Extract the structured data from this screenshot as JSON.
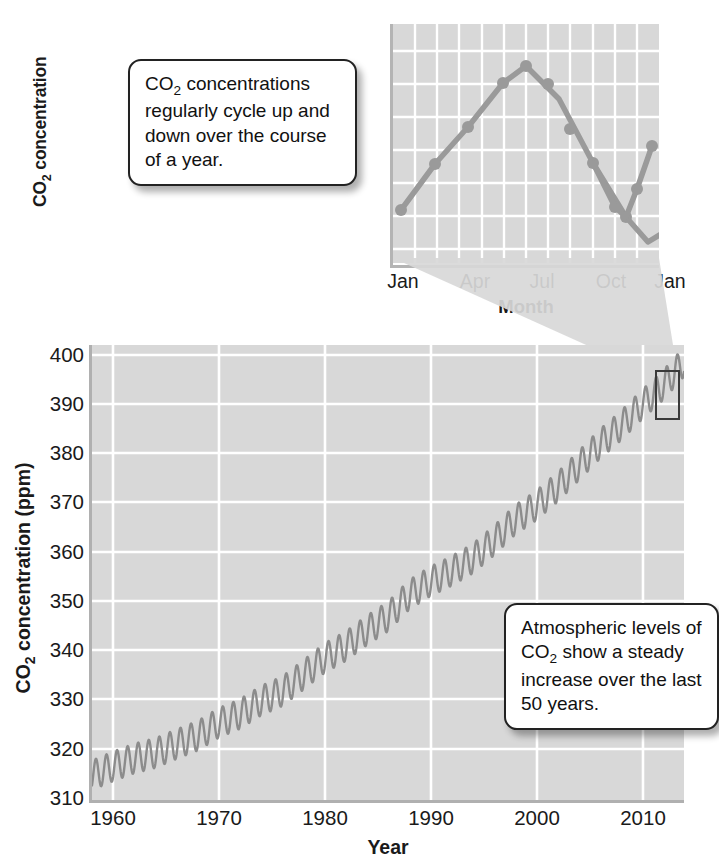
{
  "callouts": {
    "seasonal": "CO2 concentrations regularly cycle up and down over the course of a year.",
    "trend": "Atmospheric levels of CO2 show a steady increase over the last 50 years."
  },
  "colors": {
    "plot_background": "#d8d8d8",
    "gridline": "#ffffff",
    "data_line": "#8c8c8c",
    "axis": "#b0b0b0",
    "highlight_box": "#3a3a3a",
    "text": "#111111"
  },
  "chart_data": [
    {
      "id": "main",
      "type": "line",
      "title": "",
      "xlabel": "Year",
      "ylabel": "CO2 concentration (ppm)",
      "xlim": [
        1958,
        2014
      ],
      "ylim": [
        310,
        402
      ],
      "xticks": [
        1960,
        1970,
        1980,
        1990,
        2000,
        2010
      ],
      "yticks": [
        310,
        320,
        330,
        340,
        350,
        360,
        370,
        380,
        390,
        400
      ],
      "grid": true,
      "legend": "none",
      "description": "Keeling curve: annual sawtooth oscillation superimposed on a steadily rising trend.",
      "annual_trend": {
        "x": [
          1958,
          1960,
          1962,
          1964,
          1966,
          1968,
          1970,
          1972,
          1974,
          1976,
          1978,
          1980,
          1982,
          1984,
          1986,
          1988,
          1990,
          1992,
          1994,
          1996,
          1998,
          2000,
          2002,
          2004,
          2006,
          2008,
          2010,
          2012,
          2014
        ],
        "y": [
          315.0,
          316.8,
          318.4,
          319.5,
          321.3,
          323.0,
          325.6,
          327.4,
          330.1,
          332.0,
          335.3,
          338.7,
          341.1,
          344.3,
          347.1,
          351.5,
          354.2,
          356.3,
          358.8,
          362.4,
          366.6,
          369.5,
          373.2,
          377.5,
          381.9,
          385.6,
          389.9,
          393.8,
          398.6
        ]
      },
      "seasonal_amplitude_ppm": 3.0,
      "seasonal_peak_month": "May",
      "seasonal_trough_month": "October",
      "highlight_box": {
        "label": "zoomed-year-highlight",
        "x_center": 2013,
        "y_range": [
          392,
          401
        ]
      }
    },
    {
      "id": "inset",
      "type": "line",
      "title": "",
      "xlabel": "Month",
      "ylabel": "CO2 concentration",
      "xticks": [
        "Jan",
        "Apr",
        "Jul",
        "Oct",
        "Jan"
      ],
      "yticks": [],
      "grid": true,
      "markers": true,
      "legend": "none",
      "description": "One year of the monthly CO2 cycle: rises from January to a May maximum, falls to an October minimum, then rises again.",
      "categories": [
        "Jan",
        "Feb",
        "Mar",
        "Apr",
        "May",
        "Jun",
        "Jul",
        "Aug",
        "Sep",
        "Oct",
        "Nov",
        "Dec",
        "Jan"
      ],
      "values": [
        2.9,
        4.4,
        5.9,
        7.6,
        8.3,
        6.9,
        5.0,
        2.6,
        1.0,
        1.6,
        3.4,
        4.8,
        6.3
      ]
    }
  ]
}
